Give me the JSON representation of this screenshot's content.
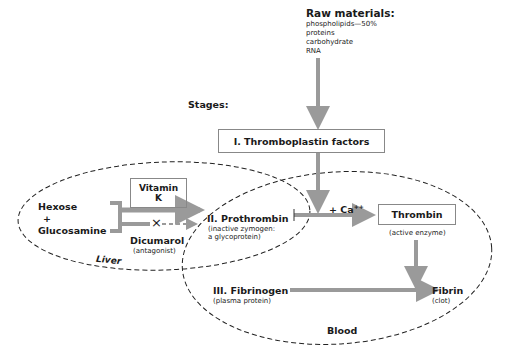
{
  "raw_materials": {
    "title": "Raw materials:",
    "items": [
      "phospholipids—50%",
      "proteins",
      "carbohydrate",
      "RNA"
    ]
  },
  "stages_label": "Stages:",
  "stage1": {
    "label": "I. Thromboplastin factors"
  },
  "liver": {
    "label": "Liver",
    "substrates": {
      "line1": "Hexose",
      "line2": "+",
      "line3": "Glucosamine"
    },
    "vitamin_k": {
      "line1": "Vitamin",
      "line2": "K"
    },
    "inhibitor": {
      "label": "Dicumarol",
      "note": "(antagonist)",
      "symbol": "×"
    }
  },
  "stage2": {
    "label": "II. Prothrombin",
    "note1": "(inactive zymogen:",
    "note2": "a glycoprotein)"
  },
  "cofactor": {
    "label": "+ Ca",
    "superscript": "++"
  },
  "thrombin": {
    "label": "Thrombin",
    "note": "(active enzyme)"
  },
  "stage3": {
    "label": "III. Fibrinogen",
    "note": "(plasma protein)"
  },
  "fibrin": {
    "label": "Fibrin",
    "note": "(clot)"
  },
  "blood": {
    "label": "Blood"
  },
  "colors": {
    "arrow": "#9a9a9a",
    "line": "#222222",
    "box_border": "#888888"
  }
}
